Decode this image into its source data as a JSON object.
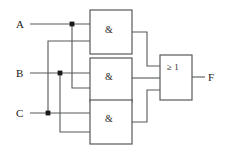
{
  "diagram": {
    "type": "logic-circuit",
    "background_color": "#ffffff",
    "wire_color": "#55595c",
    "text_color": "#1a1a1a"
  },
  "inputs": [
    {
      "id": "A",
      "label": "A",
      "y": 24
    },
    {
      "id": "B",
      "label": "B",
      "y": 73
    },
    {
      "id": "C",
      "label": "C",
      "y": 113
    }
  ],
  "outputs": [
    {
      "id": "F",
      "label": "F",
      "y": 77
    }
  ],
  "gates": [
    {
      "id": "and1",
      "label": "&",
      "type": "AND",
      "x": 90,
      "y": 10,
      "w": 42,
      "h": 44
    },
    {
      "id": "and2",
      "label": "&",
      "type": "AND",
      "x": 90,
      "y": 58,
      "w": 42,
      "h": 44
    },
    {
      "id": "and3",
      "label": "&",
      "type": "AND",
      "x": 90,
      "y": 100,
      "w": 42,
      "h": 44
    },
    {
      "id": "or1",
      "label": "≥ 1",
      "type": "OR",
      "x": 160,
      "y": 55,
      "w": 32,
      "h": 45
    }
  ],
  "junctions": [
    {
      "id": "junction-a",
      "on": "A",
      "x": 72,
      "y": 24
    },
    {
      "id": "junction-b",
      "on": "B",
      "x": 60,
      "y": 73
    },
    {
      "id": "junction-c",
      "on": "C",
      "x": 48,
      "y": 113
    }
  ],
  "connections": [
    {
      "from": "A",
      "to": "and1.in1"
    },
    {
      "from": "A",
      "to": "and2.in2"
    },
    {
      "from": "B",
      "to": "and2.in1"
    },
    {
      "from": "B",
      "to": "and3.in2"
    },
    {
      "from": "C",
      "to": "and1.in2"
    },
    {
      "from": "C",
      "to": "and3.in1"
    },
    {
      "from": "and1.out",
      "to": "or1.in1"
    },
    {
      "from": "and2.out",
      "to": "or1.in2"
    },
    {
      "from": "and3.out",
      "to": "or1.in3"
    },
    {
      "from": "or1.out",
      "to": "F"
    }
  ]
}
